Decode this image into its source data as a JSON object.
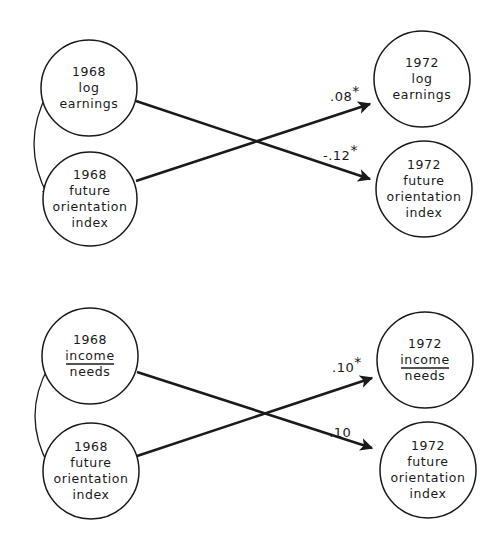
{
  "colors": {
    "ink": "#1a1a1a",
    "background": "#ffffff"
  },
  "panels": [
    {
      "id": "earnings",
      "nodes": [
        {
          "id": "e1968_earn",
          "lines": [
            "1968",
            "log",
            "earnings"
          ],
          "underline": null,
          "cx": 89,
          "cy": 88,
          "r": 48
        },
        {
          "id": "e1968_fut",
          "lines": [
            "1968",
            "future",
            "orientation",
            "index"
          ],
          "underline": null,
          "cx": 90,
          "cy": 199,
          "r": 47
        },
        {
          "id": "e1972_earn",
          "lines": [
            "1972",
            "log",
            "earnings"
          ],
          "underline": null,
          "cx": 422,
          "cy": 79,
          "r": 48
        },
        {
          "id": "e1972_fut",
          "lines": [
            "1972",
            "future",
            "orientation",
            "index"
          ],
          "underline": null,
          "cx": 424,
          "cy": 189,
          "r": 48
        }
      ],
      "edges": [
        {
          "from": "e1968_fut",
          "to": "e1972_earn",
          "coef": ".08",
          "significant": true,
          "x1": 136,
          "y1": 181,
          "x2": 370,
          "y2": 104,
          "label_x": 330,
          "label_y": 101
        },
        {
          "from": "e1968_earn",
          "to": "e1972_fut",
          "coef": "-.12",
          "significant": true,
          "x1": 136,
          "y1": 101,
          "x2": 370,
          "y2": 179,
          "label_x": 323,
          "label_y": 160
        }
      ],
      "correlation": {
        "x": 42,
        "y1": 92,
        "y2": 196
      }
    },
    {
      "id": "income",
      "nodes": [
        {
          "id": "i1968_inc",
          "lines": [
            "1968",
            "income",
            "needs"
          ],
          "underline": 1,
          "cx": 90,
          "cy": 356,
          "r": 48
        },
        {
          "id": "i1968_fut",
          "lines": [
            "1968",
            "future",
            "orientation",
            "index"
          ],
          "underline": null,
          "cx": 91,
          "cy": 471,
          "r": 48
        },
        {
          "id": "i1972_inc",
          "lines": [
            "1972",
            "income",
            "needs"
          ],
          "underline": 1,
          "cx": 425,
          "cy": 360,
          "r": 48
        },
        {
          "id": "i1972_fut",
          "lines": [
            "1972",
            "future",
            "orientation",
            "index"
          ],
          "underline": null,
          "cx": 428,
          "cy": 470,
          "r": 48
        }
      ],
      "edges": [
        {
          "from": "i1968_fut",
          "to": "i1972_inc",
          "coef": ".10",
          "significant": true,
          "x1": 137,
          "y1": 456,
          "x2": 372,
          "y2": 378,
          "label_x": 332,
          "label_y": 372
        },
        {
          "from": "i1968_inc",
          "to": "i1972_fut",
          "coef": "-.10",
          "significant": false,
          "x1": 137,
          "y1": 372,
          "x2": 372,
          "y2": 448,
          "label_x": 324,
          "label_y": 437
        }
      ],
      "correlation": {
        "x": 43,
        "y1": 366,
        "y2": 466
      }
    }
  ],
  "significance_marker": "*"
}
